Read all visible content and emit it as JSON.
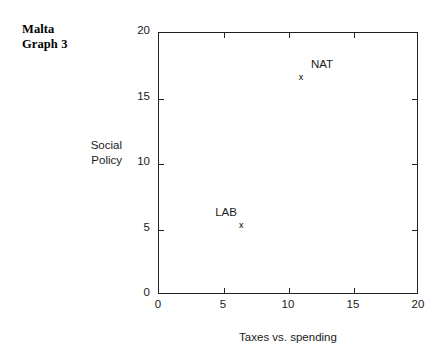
{
  "chart_data": {
    "type": "scatter",
    "title": "Malta\nGraph 3",
    "xlabel": "Taxes vs. spending",
    "ylabel": "Social\nPolicy",
    "xlim": [
      0,
      20
    ],
    "ylim": [
      0,
      20
    ],
    "xticks": [
      0,
      5,
      10,
      15,
      20
    ],
    "yticks": [
      0,
      5,
      10,
      15,
      20
    ],
    "xtick_labels": [
      "0",
      "5",
      "10",
      "15",
      "20"
    ],
    "ytick_labels": [
      "0",
      "5",
      "10",
      "15",
      "20"
    ],
    "grid": false,
    "legend": false,
    "marker": "x",
    "points": [
      {
        "label": "LAB",
        "x": 6.4,
        "y": 5.2,
        "label_dx": -26,
        "label_dy": -20
      },
      {
        "label": "NAT",
        "x": 11.0,
        "y": 16.5,
        "label_dx": 10,
        "label_dy": -20
      }
    ]
  }
}
